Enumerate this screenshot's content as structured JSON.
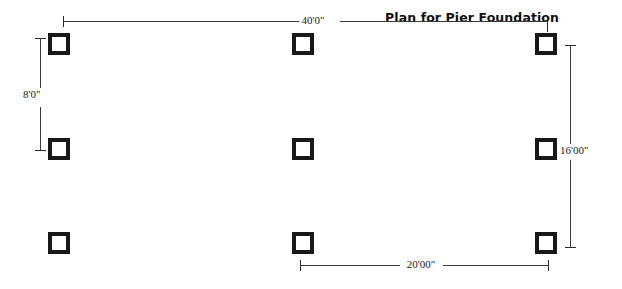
{
  "drawing": {
    "title": "Plan for Pier Foundation",
    "background_color": "#ffffff",
    "line_color": "#3a3a3a",
    "pier_color": "#181818",
    "piers": [
      {
        "label": "pier-r1-c1",
        "row": 1,
        "col": 1,
        "x": 48,
        "y": 33,
        "size": 22
      },
      {
        "label": "pier-r1-c2",
        "row": 1,
        "col": 2,
        "x": 292,
        "y": 33,
        "size": 22
      },
      {
        "label": "pier-r1-c3",
        "row": 1,
        "col": 3,
        "x": 535,
        "y": 33,
        "size": 22
      },
      {
        "label": "pier-r2-c1",
        "row": 2,
        "col": 1,
        "x": 48,
        "y": 138,
        "size": 22
      },
      {
        "label": "pier-r2-c2",
        "row": 2,
        "col": 2,
        "x": 292,
        "y": 138,
        "size": 22
      },
      {
        "label": "pier-r2-c3",
        "row": 2,
        "col": 3,
        "x": 535,
        "y": 138,
        "size": 22
      },
      {
        "label": "pier-r3-c1",
        "row": 3,
        "col": 1,
        "x": 48,
        "y": 232,
        "size": 22
      },
      {
        "label": "pier-r3-c2",
        "row": 3,
        "col": 2,
        "x": 292,
        "y": 232,
        "size": 22
      },
      {
        "label": "pier-r3-c3",
        "row": 3,
        "col": 3,
        "x": 535,
        "y": 232,
        "size": 22
      }
    ],
    "dimensions": {
      "top": {
        "name": "overall-width",
        "value": "40'0\""
      },
      "left": {
        "name": "pier-spacing-vertical",
        "value": "8'0\""
      },
      "right": {
        "name": "overall-depth",
        "value": "16'00\""
      },
      "bottom": {
        "name": "pier-spacing-horizontal",
        "value": "20'00\""
      }
    }
  }
}
